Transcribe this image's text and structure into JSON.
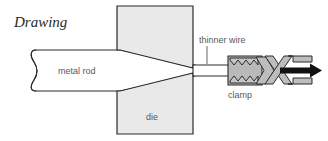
{
  "figure": {
    "title": "Drawing",
    "process_type": "wire drawing",
    "canvas": {
      "width": 328,
      "height": 141,
      "background": "#ffffff"
    }
  },
  "labels": {
    "title": "Drawing",
    "metal_rod": "metal rod",
    "die": "die",
    "thinner_wire": "thinner wire",
    "clamp": "clamp"
  },
  "colors": {
    "background": "#ffffff",
    "outline": "#2b2b2b",
    "die_fill": "#e9e9e9",
    "clamp_fill": "#b9b9b9",
    "clamp_jaw_fill": "#c6c6c6",
    "rod_fill": "#ffffff",
    "label_text": "#585858",
    "title_text": "#2b2b2b",
    "arrow": "#111111"
  },
  "parts": [
    {
      "name": "metal-rod",
      "label": "metal rod",
      "side": "left",
      "description": "thick rod entering the die, drawn with a broken-end symbol"
    },
    {
      "name": "upper-die",
      "label": "die",
      "side": "top",
      "description": "upper die block with angled inner face"
    },
    {
      "name": "lower-die",
      "label": "die",
      "side": "bottom",
      "description": "lower die block with angled inner face"
    },
    {
      "name": "thinner-wire",
      "label": "thinner wire",
      "side": "right",
      "description": "reduced-diameter wire exiting the die"
    },
    {
      "name": "clamp",
      "label": "clamp",
      "side": "right",
      "description": "toothed gripping clamp with scissor linkage"
    },
    {
      "name": "pull-arrow",
      "label": "",
      "side": "right",
      "description": "arrow showing pulling direction to the right"
    }
  ],
  "icons": {
    "pull_direction_arrow": "arrow-right-icon",
    "break_symbol": "broken-end-icon"
  }
}
